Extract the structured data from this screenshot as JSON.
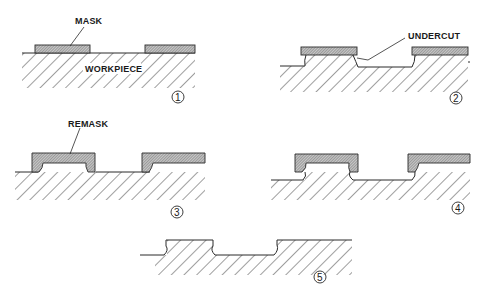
{
  "figure": {
    "colors": {
      "ink": "#2a2a2a",
      "mask_fill": "#9a9a9a",
      "background": "#ffffff"
    },
    "steps": [
      {
        "id": 1,
        "number_label": "1",
        "labels": {
          "mask": "MASK",
          "workpiece": "WORKPIECE"
        }
      },
      {
        "id": 2,
        "number_label": "2",
        "labels": {
          "undercut": "UNDERCUT"
        }
      },
      {
        "id": 3,
        "number_label": "3",
        "labels": {
          "remask": "REMASK"
        }
      },
      {
        "id": 4,
        "number_label": "4",
        "labels": {}
      },
      {
        "id": 5,
        "number_label": "5",
        "labels": {}
      }
    ]
  }
}
